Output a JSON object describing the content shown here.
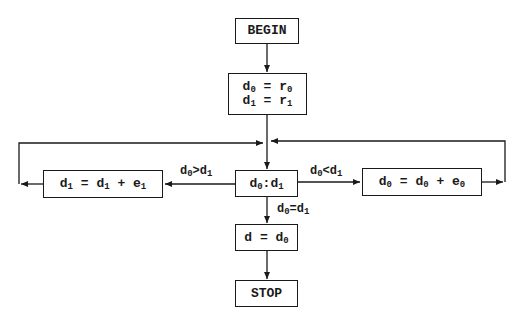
{
  "diagram": {
    "type": "flowchart",
    "nodes": {
      "begin": {
        "label": "BEGIN"
      },
      "init": {
        "line1_main": "d",
        "line1_sub": "0",
        "line1_rest": " = r",
        "line1_sub2": "0",
        "line2_main": "d",
        "line2_sub": "1",
        "line2_rest": " = r",
        "line2_sub2": "1"
      },
      "compare": {
        "a": "d",
        "a_sub": "0",
        "op": ":",
        "b": "d",
        "b_sub": "1"
      },
      "update_d1": {
        "p1": "d",
        "s1": "1",
        "p2": " = d",
        "s2": "1",
        "p3": " + e",
        "s3": "1"
      },
      "update_d0": {
        "p1": "d",
        "s1": "0",
        "p2": " = d",
        "s2": "0",
        "p3": " + e",
        "s3": "0"
      },
      "assign": {
        "p1": "d = d",
        "s1": "0"
      },
      "stop": {
        "label": "STOP"
      }
    },
    "edges": {
      "gt": {
        "a": "d",
        "a_sub": "0",
        "op": ">",
        "b": "d",
        "b_sub": "1"
      },
      "lt": {
        "a": "d",
        "a_sub": "0",
        "op": "<",
        "b": "d",
        "b_sub": "1"
      },
      "eq": {
        "a": "d",
        "a_sub": "0",
        "op": "=",
        "b": "d",
        "b_sub": "1"
      }
    },
    "line_color": "#1a1a1a"
  }
}
